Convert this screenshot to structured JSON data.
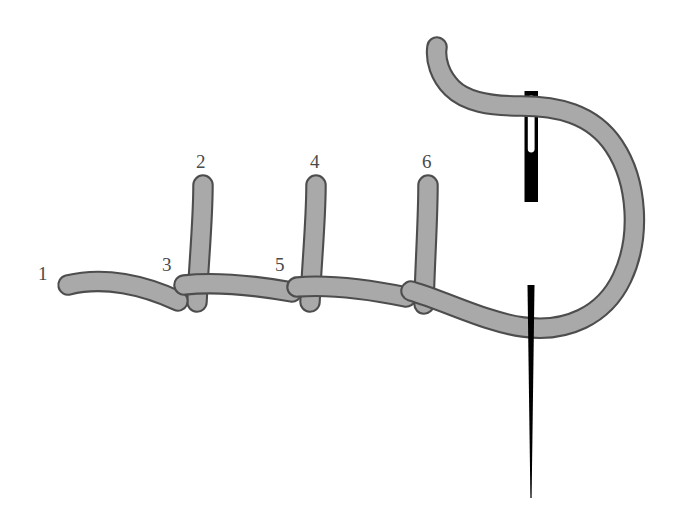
{
  "figure": {
    "kind": "embroidery-stitch-diagram",
    "title": "",
    "background_color": "#ffffff"
  },
  "colors": {
    "thread_fill": "#a9a9a9",
    "thread_outline": "#4d4d4d",
    "needle": "#000000",
    "label_text": "#4a4a4a",
    "background": "#ffffff"
  },
  "thread": {
    "name": "embroidery-thread",
    "fill": "#a9a9a9",
    "stroke": "#4d4d4d",
    "stroke_width": 2.2,
    "band_width": 17,
    "cap": "round"
  },
  "needle": {
    "name": "sewing-needle",
    "color": "#000000",
    "shaft_top_x": 531,
    "shaft_top_y": 92,
    "shaft_bottom_y": 201,
    "shaft_width": 13,
    "eye_width": 5,
    "eye_top_y": 99,
    "eye_bottom_y": 152,
    "tip_top_y": 285,
    "tip_bottom_y": 500,
    "tip_width": 7
  },
  "labels": [
    {
      "id": "label-1",
      "text": "1",
      "x": 38,
      "y": 264,
      "anchor_point": "thread-start"
    },
    {
      "id": "label-2",
      "text": "2",
      "x": 196,
      "y": 152,
      "anchor_point": "stitch-top-1"
    },
    {
      "id": "label-3",
      "text": "3",
      "x": 162,
      "y": 255,
      "anchor_point": "stitch-base-1"
    },
    {
      "id": "label-4",
      "text": "4",
      "x": 310,
      "y": 152,
      "anchor_point": "stitch-top-2"
    },
    {
      "id": "label-5",
      "text": "5",
      "x": 275,
      "y": 255,
      "anchor_point": "stitch-base-2"
    },
    {
      "id": "label-6",
      "text": "6",
      "x": 422,
      "y": 152,
      "anchor_point": "stitch-top-3"
    }
  ],
  "stitches": [
    {
      "name": "vertical-stitch-2-3",
      "top_x": 202,
      "top_y": 184,
      "bottom_x": 196,
      "bottom_y": 300
    },
    {
      "name": "vertical-stitch-4-5",
      "top_x": 315,
      "top_y": 184,
      "bottom_x": 310,
      "bottom_y": 300
    },
    {
      "name": "vertical-stitch-6",
      "top_x": 427,
      "top_y": 184,
      "bottom_x": 424,
      "bottom_y": 300
    }
  ],
  "paths": {
    "thread_tail_left": "M 66,284 C 110,277 150,288 182,300",
    "thread_running": "M 168,292 C 220,314 262,300 300,290 C 340,282 380,296 420,312 C 470,334 520,338 560,316 C 605,292 625,240 622,196 C 618,150 585,118 545,112 C 505,106 470,108 446,92 C 430,80 430,60 437,48",
    "needle_shaft": "M 525,92 L 538,92 L 538,201 L 525,201 Z"
  }
}
